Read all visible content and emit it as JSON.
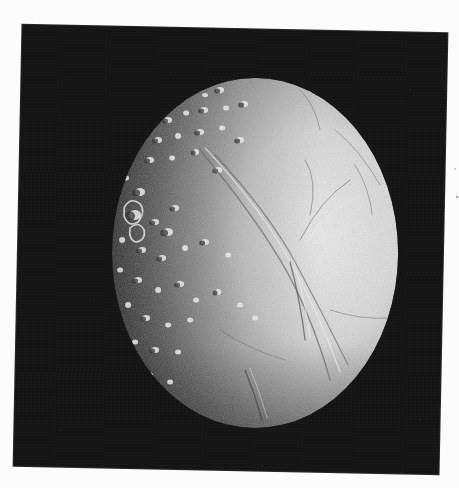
{
  "image": {
    "subject": "Cratered icy moon (Enceladus-like) on black background",
    "description": "Grayscale scanned photograph of a moon disc, lit from the right; heavily cratered darker left hemisphere, bright smoother right hemisphere crossed by ridges and grooves",
    "colors": {
      "page_background": "#fcfcfc",
      "frame_background": "#141414",
      "moon_bright": "#e6e6e6",
      "moon_mid": "#9a9a9a",
      "moon_dark": "#3a3a3a"
    },
    "frame": {
      "corners": {
        "top_left": [
          22,
          25
        ],
        "top_right": [
          447,
          34
        ],
        "bottom_left": [
          13,
          466
        ],
        "bottom_right": [
          439,
          473
        ]
      },
      "rotation_deg": 1.15
    },
    "moon": {
      "center": [
        255,
        253
      ],
      "rx": 143,
      "ry": 175,
      "lit_side": "right"
    }
  },
  "labels": {
    "caption": ""
  }
}
